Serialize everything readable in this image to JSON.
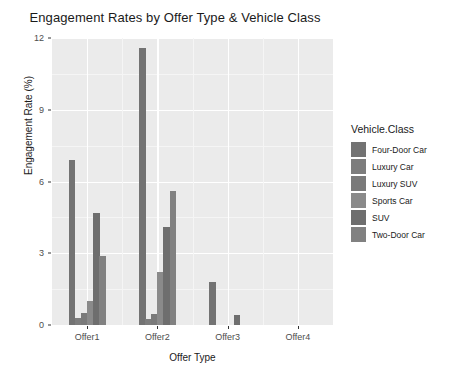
{
  "chart_data": {
    "type": "bar",
    "title": "Engagement Rates by Offer Type & Vehicle Class",
    "xlabel": "Offer Type",
    "ylabel": "Engagement Rate (%)",
    "categories": [
      "Offer1",
      "Offer2",
      "Offer3",
      "Offer4"
    ],
    "ylim": [
      0,
      12
    ],
    "yticks": [
      0,
      3,
      6,
      9,
      12
    ],
    "ytick_labels": [
      "0",
      "3",
      "6",
      "9",
      "12"
    ],
    "yminor": [
      1.5,
      4.5,
      7.5,
      10.5
    ],
    "grid": true,
    "legend_position": "right",
    "legend_title": "Vehicle.Class",
    "series": [
      {
        "name": "Four-Door Car",
        "color": "#737373",
        "values": [
          6.9,
          11.6,
          1.8,
          0.0
        ]
      },
      {
        "name": "Luxury Car",
        "color": "#7d7d7d",
        "values": [
          0.3,
          0.25,
          0.0,
          0.0
        ]
      },
      {
        "name": "Luxury SUV",
        "color": "#7a7a7a",
        "values": [
          0.5,
          0.45,
          0.0,
          0.0
        ]
      },
      {
        "name": "Sports Car",
        "color": "#8a8a8a",
        "values": [
          1.0,
          2.2,
          0.0,
          0.0
        ]
      },
      {
        "name": "SUV",
        "color": "#6e6e6e",
        "values": [
          4.7,
          4.1,
          0.4,
          0.0
        ]
      },
      {
        "name": "Two-Door Car",
        "color": "#818181",
        "values": [
          2.9,
          5.6,
          0.0,
          0.0
        ]
      }
    ]
  }
}
